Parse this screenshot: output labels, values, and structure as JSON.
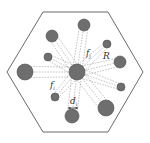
{
  "diagram": {
    "colors": {
      "background": "#ffffff",
      "hexagon_stroke": "#444444",
      "node_fill": "#6e6e6e",
      "node_stroke": "#4a4a4a",
      "edge_stroke": "#888888"
    },
    "hexagon": [
      [
        43,
        12
      ],
      [
        108,
        12
      ],
      [
        143,
        72
      ],
      [
        108,
        132
      ],
      [
        43,
        132
      ],
      [
        7,
        72
      ]
    ],
    "center": {
      "x": 77,
      "y": 72,
      "r": 8
    },
    "nodes": [
      {
        "x": 84,
        "y": 25,
        "r": 6
      },
      {
        "x": 52,
        "y": 36,
        "r": 6
      },
      {
        "x": 107,
        "y": 44,
        "r": 4
      },
      {
        "x": 48,
        "y": 57,
        "r": 4
      },
      {
        "x": 120,
        "y": 62,
        "r": 6
      },
      {
        "x": 25,
        "y": 72,
        "r": 8
      },
      {
        "x": 121,
        "y": 87,
        "r": 4
      },
      {
        "x": 55,
        "y": 97,
        "r": 4
      },
      {
        "x": 72,
        "y": 116,
        "r": 7
      },
      {
        "x": 106,
        "y": 108,
        "r": 8
      }
    ],
    "labels": {
      "fj": {
        "main": "f",
        "sub": "j"
      },
      "R": "R",
      "fi": {
        "main": "f",
        "sub": "i"
      },
      "di": {
        "main": "d",
        "sub": "i"
      }
    }
  }
}
